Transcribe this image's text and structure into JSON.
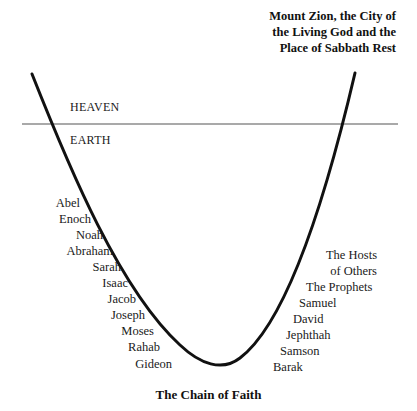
{
  "title": {
    "lines": [
      "Mount Zion, the City of",
      "the Living God and the",
      "Place of Sabbath Rest"
    ]
  },
  "realms": {
    "upper": "HEAVEN",
    "lower": "EARTH"
  },
  "left_names": [
    "Abel",
    "Enoch",
    "Noah",
    "Abraham",
    "Sarah",
    "Isaac",
    "Jacob",
    "Joseph",
    "Moses",
    "Rahab",
    "Gideon"
  ],
  "right_names": [
    "The Hosts",
    "of Others",
    "The Prophets",
    "Samuel",
    "David",
    "Jephthah",
    "Samson",
    "Barak"
  ],
  "caption": "The Chain of Faith",
  "colors": {
    "curve": "#111111",
    "divider": "#555555",
    "text": "#1a1a1a"
  }
}
